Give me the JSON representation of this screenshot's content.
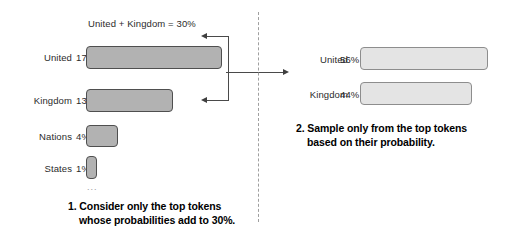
{
  "figure": {
    "type": "diagram"
  },
  "left_panel": {
    "sum_label": "United + Kingdom = 30%",
    "bars": [
      {
        "label": "United",
        "pct_text": "17%",
        "value": 17
      },
      {
        "label": "Kingdom",
        "pct_text": "13%",
        "value": 13
      },
      {
        "label": "Nations",
        "pct_text": "4%",
        "value": 4
      },
      {
        "label": "States",
        "pct_text": "1%",
        "value": 1
      }
    ],
    "ellipsis": "...",
    "caption_line1": "1. Consider only the top tokens",
    "caption_line2": "whose probabilities add to 30%."
  },
  "right_panel": {
    "bars": [
      {
        "label": "United",
        "pct_text": "56%",
        "value": 56
      },
      {
        "label": "Kingdom",
        "pct_text": "44%",
        "value": 44
      }
    ],
    "caption_line1": "2. Sample only from the top tokens",
    "caption_line2": "based on their probability."
  },
  "colors": {
    "bar_dark_fill": "#b2b2b2",
    "bar_dark_stroke": "#4f4f4f",
    "bar_light_fill": "#e4e4e4",
    "bar_light_stroke": "#8d8d8d",
    "divider": "#9f9f9f",
    "arrow": "#3f3f3f",
    "text": "#2b2b2b"
  }
}
